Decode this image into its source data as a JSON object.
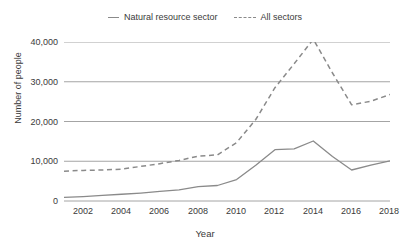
{
  "legend": {
    "position": "top-center",
    "items": [
      {
        "label": "Natural resource sector",
        "style": "solid",
        "icon": "solid-line-swatch-icon"
      },
      {
        "label": "All sectors",
        "style": "dashed",
        "icon": "dashed-line-swatch-icon"
      }
    ]
  },
  "axis": {
    "ylabel": "Number of people",
    "xlabel": "Year",
    "yticks": [
      "0",
      "10,000",
      "20,000",
      "30,000",
      "40,000"
    ],
    "xticks": [
      "2002",
      "2004",
      "2006",
      "2008",
      "2010",
      "2012",
      "2014",
      "2016",
      "2018"
    ]
  },
  "colors": {
    "line": "#8a8a8a",
    "gridline": "#9a9a9a",
    "text": "#3a3a3a",
    "background": "#ffffff"
  },
  "chart_data": {
    "type": "line",
    "title": "",
    "xlabel": "Year",
    "ylabel": "Number of people",
    "xlim": [
      2001,
      2018
    ],
    "ylim": [
      0,
      40000
    ],
    "yticks": [
      0,
      10000,
      20000,
      30000,
      40000
    ],
    "xticks": [
      2002,
      2004,
      2006,
      2008,
      2010,
      2012,
      2014,
      2016,
      2018
    ],
    "grid": "horizontal",
    "legend": "top-center",
    "x": [
      2001,
      2002,
      2003,
      2004,
      2005,
      2006,
      2007,
      2008,
      2009,
      2010,
      2011,
      2012,
      2013,
      2014,
      2015,
      2016,
      2017,
      2018
    ],
    "series": [
      {
        "name": "Natural resource sector",
        "style": "solid",
        "values": [
          900,
          1100,
          1400,
          1700,
          2000,
          2400,
          2800,
          3600,
          3900,
          5400,
          9000,
          12900,
          13100,
          15100,
          11200,
          7800,
          9000,
          10100
        ]
      },
      {
        "name": "All sectors",
        "style": "dashed",
        "values": [
          7500,
          7700,
          7800,
          8000,
          8700,
          9400,
          10200,
          11300,
          11600,
          14700,
          20500,
          28500,
          34500,
          40700,
          32200,
          24200,
          25100,
          26800
        ]
      }
    ]
  }
}
